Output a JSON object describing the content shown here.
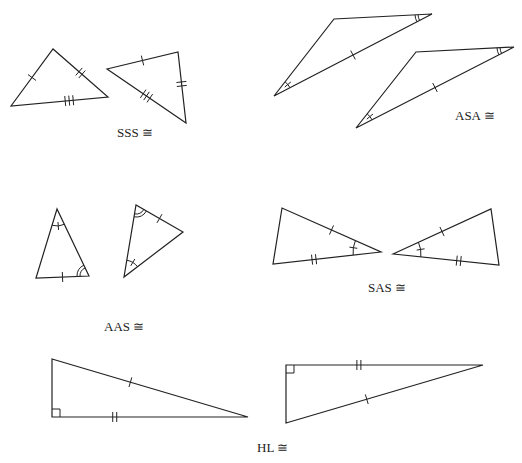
{
  "figure": {
    "stroke_color": "#222222",
    "background": "#ffffff"
  },
  "panels": [
    {
      "id": "sss",
      "label": "SSS ≅",
      "label_pos": [
        117,
        137
      ],
      "triangles": [
        {
          "points": [
            [
              11,
              106
            ],
            [
              53,
              49
            ],
            [
              108,
              97
            ]
          ]
        },
        {
          "points": [
            [
              107,
              69
            ],
            [
              178,
              52
            ],
            [
              186,
              123
            ]
          ]
        }
      ],
      "ticks": [
        {
          "a": [
            11,
            106
          ],
          "b": [
            53,
            49
          ],
          "t": 0.5,
          "n": 1
        },
        {
          "a": [
            53,
            49
          ],
          "b": [
            108,
            97
          ],
          "t": 0.5,
          "n": 2
        },
        {
          "a": [
            11,
            106
          ],
          "b": [
            108,
            97
          ],
          "t": 0.6,
          "n": 3
        },
        {
          "a": [
            107,
            69
          ],
          "b": [
            178,
            52
          ],
          "t": 0.5,
          "n": 1
        },
        {
          "a": [
            178,
            52
          ],
          "b": [
            186,
            123
          ],
          "t": 0.45,
          "n": 2
        },
        {
          "a": [
            107,
            69
          ],
          "b": [
            186,
            123
          ],
          "t": 0.5,
          "n": 3
        }
      ],
      "arcs": []
    },
    {
      "id": "asa",
      "label": "ASA ≅",
      "label_pos": [
        455,
        120
      ],
      "triangles": [
        {
          "points": [
            [
              274,
              96
            ],
            [
              334,
              19
            ],
            [
              432,
              14
            ]
          ]
        },
        {
          "points": [
            [
              356,
              128
            ],
            [
              416,
              52
            ],
            [
              514,
              47
            ]
          ]
        }
      ],
      "ticks": [
        {
          "a": [
            274,
            96
          ],
          "b": [
            432,
            14
          ],
          "t": 0.5,
          "n": 1
        },
        {
          "a": [
            356,
            128
          ],
          "b": [
            514,
            47
          ],
          "t": 0.5,
          "n": 1
        }
      ],
      "arcs": [
        {
          "v": [
            274,
            96
          ],
          "p1": [
            334,
            19
          ],
          "p2": [
            432,
            14
          ],
          "r": 18,
          "n": 1,
          "tick": true
        },
        {
          "v": [
            432,
            14
          ],
          "p1": [
            334,
            19
          ],
          "p2": [
            274,
            96
          ],
          "r": 17,
          "n": 2,
          "tick": false
        },
        {
          "v": [
            356,
            128
          ],
          "p1": [
            416,
            52
          ],
          "p2": [
            514,
            47
          ],
          "r": 18,
          "n": 1,
          "tick": true
        },
        {
          "v": [
            514,
            47
          ],
          "p1": [
            416,
            52
          ],
          "p2": [
            356,
            128
          ],
          "r": 17,
          "n": 2,
          "tick": false
        }
      ]
    },
    {
      "id": "aas",
      "label": "AAS ≅",
      "label_pos": [
        104,
        331
      ],
      "triangles": [
        {
          "points": [
            [
              36,
              278
            ],
            [
              57,
              209
            ],
            [
              89,
              276
            ]
          ]
        },
        {
          "points": [
            [
              124,
              277
            ],
            [
              136,
              205
            ],
            [
              183,
              232
            ]
          ]
        }
      ],
      "ticks": [
        {
          "a": [
            36,
            278
          ],
          "b": [
            89,
            276
          ],
          "t": 0.5,
          "n": 1
        },
        {
          "a": [
            136,
            205
          ],
          "b": [
            183,
            232
          ],
          "t": 0.5,
          "n": 1
        }
      ],
      "arcs": [
        {
          "v": [
            57,
            209
          ],
          "p1": [
            36,
            278
          ],
          "p2": [
            89,
            276
          ],
          "r": 17,
          "n": 1,
          "tick": true
        },
        {
          "v": [
            89,
            276
          ],
          "p1": [
            57,
            209
          ],
          "p2": [
            36,
            278
          ],
          "r": 12,
          "n": 2,
          "tick": false
        },
        {
          "v": [
            124,
            277
          ],
          "p1": [
            136,
            205
          ],
          "p2": [
            183,
            232
          ],
          "r": 17,
          "n": 1,
          "tick": true
        },
        {
          "v": [
            136,
            205
          ],
          "p1": [
            124,
            277
          ],
          "p2": [
            183,
            232
          ],
          "r": 12,
          "n": 2,
          "tick": false
        }
      ]
    },
    {
      "id": "sas",
      "label": "SAS ≅",
      "label_pos": [
        368,
        292
      ],
      "triangles": [
        {
          "points": [
            [
              273,
              264
            ],
            [
              282,
              208
            ],
            [
              381,
              252
            ]
          ]
        },
        {
          "points": [
            [
              393,
              254
            ],
            [
              491,
              209
            ],
            [
              499,
              265
            ]
          ]
        }
      ],
      "ticks": [
        {
          "a": [
            282,
            208
          ],
          "b": [
            381,
            252
          ],
          "t": 0.5,
          "n": 1
        },
        {
          "a": [
            273,
            264
          ],
          "b": [
            381,
            252
          ],
          "t": 0.38,
          "n": 2
        },
        {
          "a": [
            393,
            254
          ],
          "b": [
            491,
            209
          ],
          "t": 0.5,
          "n": 1
        },
        {
          "a": [
            393,
            254
          ],
          "b": [
            499,
            265
          ],
          "t": 0.62,
          "n": 2
        }
      ],
      "arcs": [
        {
          "v": [
            381,
            252
          ],
          "p1": [
            282,
            208
          ],
          "p2": [
            273,
            264
          ],
          "r": 28,
          "n": 1,
          "tick": true
        },
        {
          "v": [
            393,
            254
          ],
          "p1": [
            491,
            209
          ],
          "p2": [
            499,
            265
          ],
          "r": 28,
          "n": 1,
          "tick": true
        }
      ]
    },
    {
      "id": "hl",
      "label": "HL ≅",
      "label_pos": [
        257,
        452
      ],
      "triangles": [
        {
          "points": [
            [
              52,
              359
            ],
            [
              52,
              417
            ],
            [
              248,
              417
            ]
          ]
        },
        {
          "points": [
            [
              286,
              365
            ],
            [
              483,
              365
            ],
            [
              286,
              423
            ]
          ]
        }
      ],
      "ticks": [
        {
          "a": [
            52,
            359
          ],
          "b": [
            248,
            417
          ],
          "t": 0.4,
          "n": 1
        },
        {
          "a": [
            52,
            417
          ],
          "b": [
            248,
            417
          ],
          "t": 0.32,
          "n": 2
        },
        {
          "a": [
            286,
            423
          ],
          "b": [
            483,
            365
          ],
          "t": 0.41,
          "n": 1
        },
        {
          "a": [
            286,
            365
          ],
          "b": [
            483,
            365
          ],
          "t": 0.37,
          "n": 2
        }
      ],
      "right_angles": [
        {
          "v": [
            52,
            417
          ],
          "dx": 1,
          "dy": -1,
          "s": 8
        },
        {
          "v": [
            286,
            365
          ],
          "dx": 1,
          "dy": 1,
          "s": 8
        }
      ],
      "arcs": []
    }
  ]
}
